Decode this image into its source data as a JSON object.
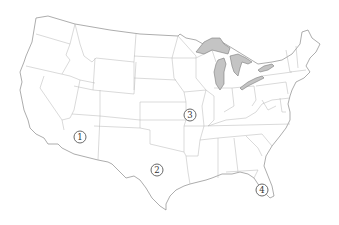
{
  "map": {
    "title": "Contiguous United States",
    "region_fill": "#ffffff",
    "lake_fill": "#c4c4c4",
    "border_color": "#b4b4b4",
    "outline_color": "#8a8a8a",
    "markers": [
      {
        "id": "1",
        "label": "1",
        "x": 80,
        "y": 137,
        "region": "Arizona"
      },
      {
        "id": "2",
        "label": "2",
        "x": 157,
        "y": 170,
        "region": "Texas"
      },
      {
        "id": "3",
        "label": "3",
        "x": 190,
        "y": 115,
        "region": "Missouri"
      },
      {
        "id": "4",
        "label": "4",
        "x": 262,
        "y": 190,
        "region": "Florida"
      }
    ]
  }
}
